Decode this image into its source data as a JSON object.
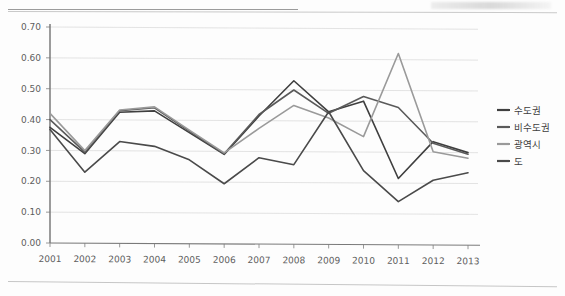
{
  "chart_data": {
    "type": "line",
    "title": "",
    "xlabel": "",
    "ylabel": "",
    "categories": [
      2001,
      2002,
      2003,
      2004,
      2005,
      2006,
      2007,
      2008,
      2009,
      2010,
      2011,
      2012,
      2013
    ],
    "x_tick_labels": [
      "2001",
      "2002",
      "2003",
      "2004",
      "2005",
      "2006",
      "2007",
      "2008",
      "2009",
      "2010",
      "2011",
      "2012",
      "2013"
    ],
    "y_tick_labels": [
      "0.00",
      "0.10",
      "0.20",
      "0.30",
      "0.40",
      "0.50",
      "0.60",
      "0.70"
    ],
    "y_ticks": [
      0.0,
      0.1,
      0.2,
      0.3,
      0.4,
      0.5,
      0.6,
      0.7
    ],
    "ylim": [
      0.0,
      0.7
    ],
    "grid": "horizontal",
    "legend_position": "right",
    "series": [
      {
        "name": "수도권",
        "color": "#3f3f3f",
        "values": [
          0.375,
          0.29,
          0.425,
          0.43,
          0.36,
          0.29,
          0.415,
          0.53,
          0.43,
          0.465,
          0.215,
          0.335,
          0.3
        ]
      },
      {
        "name": "비수도권",
        "color": "#5a5a5a",
        "values": [
          0.4,
          0.295,
          0.43,
          0.44,
          0.365,
          0.292,
          0.42,
          0.5,
          0.425,
          0.48,
          0.445,
          0.33,
          0.295
        ]
      },
      {
        "name": "광역시",
        "color": "#9a9a9a",
        "values": [
          0.42,
          0.3,
          0.432,
          0.443,
          0.368,
          0.295,
          0.375,
          0.45,
          0.41,
          0.35,
          0.62,
          0.302,
          0.282
        ]
      },
      {
        "name": "도",
        "color": "#4a4a4a",
        "values": [
          0.368,
          0.23,
          0.33,
          0.315,
          0.272,
          0.195,
          0.28,
          0.258,
          0.43,
          0.24,
          0.14,
          0.21,
          0.235
        ]
      }
    ]
  },
  "legend": {
    "items": [
      {
        "label": "수도권"
      },
      {
        "label": "비수도권"
      },
      {
        "label": "광역시"
      },
      {
        "label": "도"
      }
    ]
  }
}
